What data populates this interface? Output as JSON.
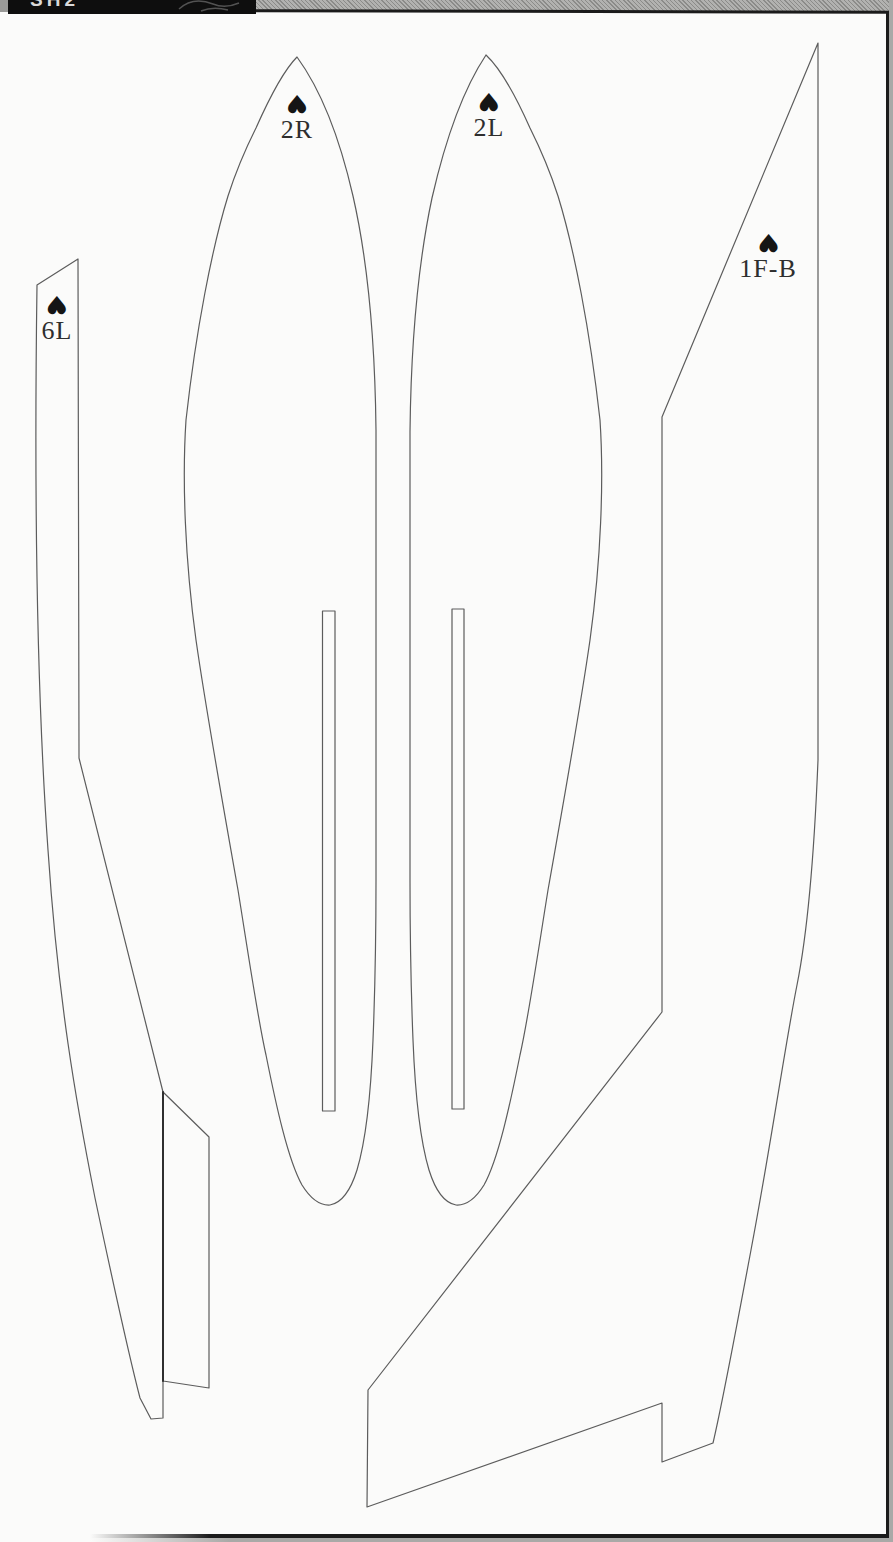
{
  "page": {
    "scan": {
      "header_fragment": "SH2",
      "header_bar_color": "#0e0e0e",
      "margin_strip_color": "#a9a9a7",
      "border_color": "#1b1b1b",
      "paper_color": "#fbfbfa"
    }
  },
  "sheet": {
    "outline_color": "#5c5c5c",
    "panel_edge_color": "#2f2f2f",
    "label_color": "#2e2e2e",
    "symbol_glyph": "♥",
    "parts": [
      {
        "id": "6L",
        "label": "6L"
      },
      {
        "id": "2R",
        "label": "2R"
      },
      {
        "id": "2L",
        "label": "2L"
      },
      {
        "id": "1F-B",
        "label": "1F-B"
      }
    ]
  }
}
